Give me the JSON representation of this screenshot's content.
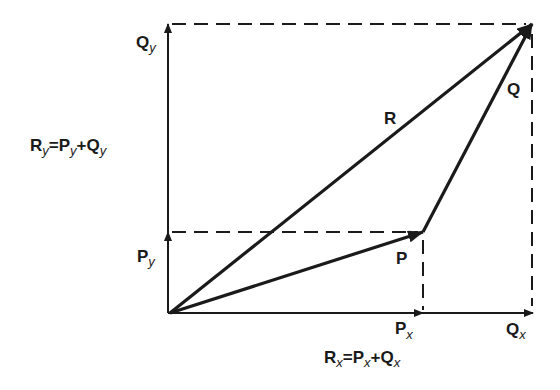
{
  "diagram": {
    "type": "vector-addition",
    "origin": [
      170,
      313
    ],
    "vectors": {
      "P": {
        "label": "P",
        "from": [
          170,
          313
        ],
        "to": [
          423,
          232
        ]
      },
      "Q": {
        "label": "Q",
        "from": [
          423,
          232
        ],
        "to": [
          532,
          24
        ]
      },
      "R": {
        "label": "R",
        "from": [
          170,
          313
        ],
        "to": [
          532,
          24
        ]
      }
    },
    "components": {
      "Px": {
        "main": "P",
        "sub": "x"
      },
      "Qx": {
        "main": "Q",
        "sub": "x"
      },
      "Py": {
        "main": "P",
        "sub": "y"
      },
      "Qy": {
        "main": "Q",
        "sub": "y"
      }
    },
    "equations": {
      "Ry": {
        "lhs_main": "R",
        "lhs_sub": "y",
        "eq": "=",
        "t1_main": "P",
        "t1_sub": "y",
        "plus": "+",
        "t2_main": "Q",
        "t2_sub": "y"
      },
      "Rx": {
        "lhs_main": "R",
        "lhs_sub": "x",
        "eq": "=",
        "t1_main": "P",
        "t1_sub": "x",
        "plus": "+",
        "t2_main": "Q",
        "t2_sub": "x"
      }
    },
    "colors": {
      "ink": "#1a1a1a",
      "background": "#ffffff"
    }
  }
}
